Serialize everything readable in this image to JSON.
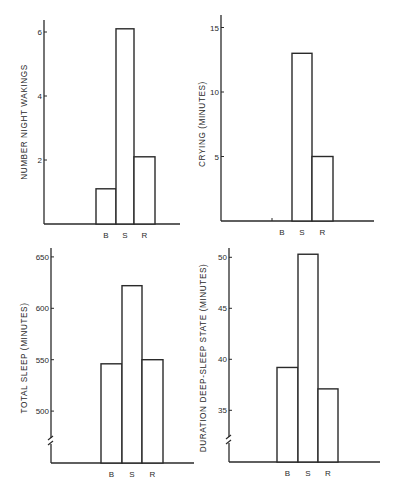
{
  "figure": {
    "panels": [
      {
        "id": "night-wakings",
        "ylabel": "NUMBER NIGHT WAKINGS"
      },
      {
        "id": "crying",
        "ylabel": "CRYING (MINUTES)"
      },
      {
        "id": "total-sleep",
        "ylabel": "TOTAL SLEEP (MINUTES)"
      },
      {
        "id": "deep-sleep",
        "ylabel": "DURATION DEEP-SLEEP STATE (MINUTES)"
      }
    ]
  },
  "chart_data": [
    {
      "type": "bar",
      "title": "",
      "xlabel": "",
      "ylabel": "NUMBER NIGHT WAKINGS",
      "categories": [
        "B",
        "S",
        "R"
      ],
      "values": [
        1.1,
        6.1,
        2.1
      ],
      "yticks": [
        2,
        4,
        6
      ],
      "ylim": [
        0,
        6.5
      ],
      "axis_break": false,
      "grid": false,
      "legend": null
    },
    {
      "type": "bar",
      "title": "",
      "xlabel": "",
      "ylabel": "CRYING (MINUTES)",
      "categories": [
        "B",
        "S",
        "R"
      ],
      "values": [
        0,
        13,
        5
      ],
      "yticks": [
        5,
        10,
        15
      ],
      "ylim": [
        0,
        16
      ],
      "axis_break": false,
      "grid": false,
      "legend": null
    },
    {
      "type": "bar",
      "title": "",
      "xlabel": "",
      "ylabel": "TOTAL SLEEP (MINUTES)",
      "categories": [
        "B",
        "S",
        "R"
      ],
      "values": [
        546,
        622,
        550
      ],
      "yticks": [
        500,
        550,
        600,
        650
      ],
      "ylim": [
        450,
        660
      ],
      "axis_break": true,
      "grid": false,
      "legend": null
    },
    {
      "type": "bar",
      "title": "",
      "xlabel": "",
      "ylabel": "DURATION DEEP-SLEEP STATE (MINUTES)",
      "categories": [
        "B",
        "S",
        "R"
      ],
      "values": [
        39.2,
        50.3,
        37.1
      ],
      "yticks": [
        35,
        40,
        45,
        50
      ],
      "ylim": [
        30,
        51
      ],
      "axis_break": true,
      "grid": false,
      "legend": null
    }
  ],
  "layout": [
    {
      "axisX": 44,
      "axisTop": 20,
      "baseY": 224,
      "baseEnd": 180,
      "barX": [
        96,
        116,
        134,
        155
      ],
      "tickY": {
        "2": 162,
        "4": 98,
        "6": 32
      },
      "zeroVal": 0,
      "pxPerUnit": 32,
      "labelX": 27,
      "labelY": 122
    },
    {
      "axisX": 221,
      "axisTop": 15,
      "baseY": 221,
      "baseEnd": 374,
      "barX": [
        272,
        292,
        312,
        333
      ],
      "tickY": {
        "5": 159,
        "10": 94,
        "15": 29
      },
      "zeroVal": 0,
      "pxPerUnit": 12.9,
      "labelX": 205,
      "labelY": 124,
      "bTickX": 272
    },
    {
      "axisX": 51,
      "axisTop": 248,
      "baseY": 463,
      "baseEnd": 194,
      "barX": [
        101,
        122,
        142,
        163
      ],
      "tickY": {
        "500": 411,
        "550": 359,
        "600": 308,
        "650": 257
      },
      "refVal": 600,
      "refY": 308.3,
      "pxPerUnit": 1.028,
      "labelX": 27,
      "labelY": 358,
      "breakY": 441
    },
    {
      "axisX": 229,
      "axisTop": 248,
      "baseY": 462,
      "baseEnd": 380,
      "barX": [
        277,
        298,
        318,
        338
      ],
      "tickY": {
        "35": 409,
        "40": 359,
        "45": 308,
        "50": 257
      },
      "refVal": 40,
      "refY": 359.3,
      "pxPerUnit": 10.2,
      "labelX": 206,
      "labelY": 358,
      "breakY": 440
    }
  ]
}
